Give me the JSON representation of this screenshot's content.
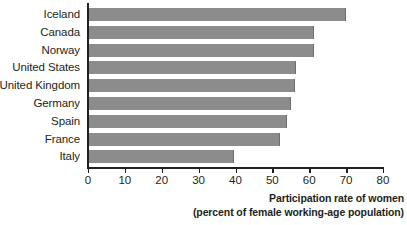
{
  "chart_data": {
    "type": "bar",
    "orientation": "horizontal",
    "title": "",
    "xlabel": "Participation rate of women (percent of female working-age population)",
    "xlabel_line1": "Participation rate of women",
    "xlabel_line2": "(percent of female working-age population)",
    "ylabel": "",
    "categories": [
      "Iceland",
      "Canada",
      "Norway",
      "United States",
      "United Kingdom",
      "Germany",
      "Spain",
      "France",
      "Italy"
    ],
    "values": [
      70.0,
      61.3,
      61.2,
      56.5,
      56.0,
      55.0,
      54.0,
      52.0,
      39.5
    ],
    "xlim": [
      0,
      80
    ],
    "xticks": [
      0,
      10,
      20,
      30,
      40,
      50,
      60,
      70,
      80
    ],
    "xtick_labels": [
      "0",
      "10",
      "20",
      "30",
      "40",
      "50",
      "60",
      "70",
      "80"
    ],
    "grid": false,
    "legend": false,
    "bar_color": "#8c8c8c",
    "axis_color": "#231f20"
  }
}
